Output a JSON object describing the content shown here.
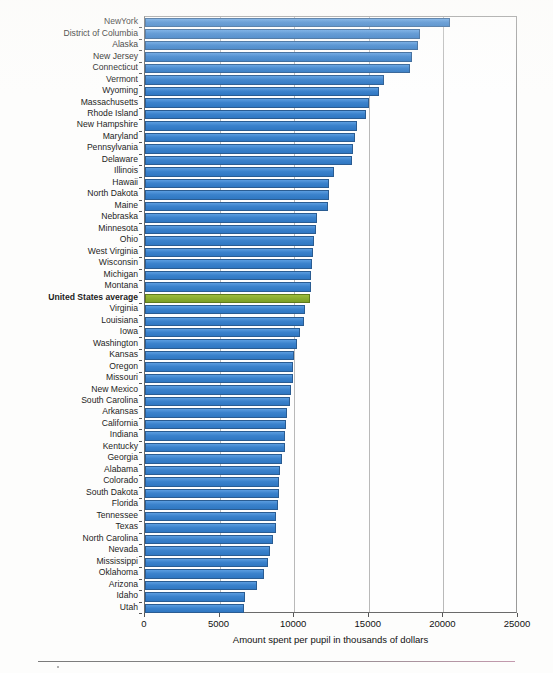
{
  "chart_data": {
    "type": "bar",
    "orientation": "horizontal",
    "title": "",
    "xlabel": "Amount spent per pupil in thousands of dollars",
    "ylabel": "",
    "xlim": [
      0,
      25000
    ],
    "xticks": [
      0,
      5000,
      10000,
      15000,
      20000,
      25000
    ],
    "xtick_labels": [
      "0",
      "5000",
      "10000",
      "15000",
      "20000",
      "25000"
    ],
    "grid": true,
    "grid_axis": "x",
    "legend": "none",
    "bar_color": "#3b82cc",
    "highlight_color": "#8aad2e",
    "highlight_category": "United States average",
    "categories": [
      "NewYork",
      "District of Columbia",
      "Alaska",
      "New Jersey",
      "Connecticut",
      "Vermont",
      "Wyoming",
      "Massachusetts",
      "Rhode Island",
      "New Hampshire",
      "Maryland",
      "Pennsylvania",
      "Delaware",
      "Illinois",
      "Hawaii",
      "North Dakota",
      "Maine",
      "Nebraska",
      "Minnesota",
      "Ohio",
      "West Virginia",
      "Wisconsin",
      "Michigan",
      "Montana",
      "United States average",
      "Virginia",
      "Louisiana",
      "Iowa",
      "Washington",
      "Kansas",
      "Oregon",
      "Missouri",
      "New Mexico",
      "South Carolina",
      "Arkansas",
      "California",
      "Indiana",
      "Kentucky",
      "Georgia",
      "Alabama",
      "Colorado",
      "South Dakota",
      "Florida",
      "Tennessee",
      "Texas",
      "North Carolina",
      "Nevada",
      "Mississippi",
      "Oklahoma",
      "Arizona",
      "Idaho",
      "Utah"
    ],
    "values": [
      20450,
      18440,
      18300,
      17900,
      17750,
      16000,
      15700,
      15000,
      14800,
      14200,
      14050,
      13950,
      13850,
      12700,
      12350,
      12300,
      12250,
      11500,
      11450,
      11350,
      11250,
      11200,
      11150,
      11100,
      11060,
      10700,
      10650,
      10400,
      10200,
      10000,
      9950,
      9900,
      9800,
      9750,
      9500,
      9450,
      9400,
      9350,
      9200,
      9050,
      9000,
      8950,
      8900,
      8800,
      8750,
      8600,
      8400,
      8250,
      7950,
      7500,
      6700,
      6635
    ]
  }
}
